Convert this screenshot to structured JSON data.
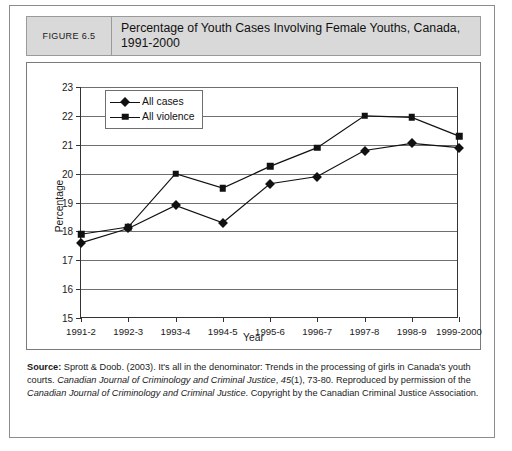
{
  "figure": {
    "number_label": "FIGURE 6.5",
    "title": "Percentage of Youth Cases Involving Female Youths, Canada, 1991-2000"
  },
  "source_note": {
    "label": "Source:",
    "part1": " Sprott & Doob. (2003). It's all in the denominator: Trends in the processing of girls in Canada's youth courts. ",
    "journal1": "Canadian Journal of Criminology and Criminal Justice",
    "part2": ", ",
    "volume": "45",
    "part3": "(1), 73-80. Reproduced by permission of the ",
    "journal2": "Canadian Journal of Criminology and Criminal Justice",
    "part4": ". Copyright by the Canadian Criminal Justice Association."
  },
  "chart_data": {
    "type": "line",
    "title": "Percentage of Youth Cases Involving Female Youths, Canada, 1991-2000",
    "xlabel": "Year",
    "ylabel": "Percentage",
    "ylim": [
      15,
      23
    ],
    "yticks": [
      15,
      16,
      17,
      18,
      19,
      20,
      21,
      22,
      23
    ],
    "grid": true,
    "legend_position": "top-left",
    "categories": [
      "1991-2",
      "1992-3",
      "1993-4",
      "1994-5",
      "1995-6",
      "1996-7",
      "1997-8",
      "1998-9",
      "1999-2000"
    ],
    "series": [
      {
        "name": "All cases",
        "marker": "diamond",
        "color": "#111111",
        "values": [
          17.6,
          18.1,
          18.9,
          18.3,
          19.65,
          19.9,
          20.8,
          21.05,
          20.9
        ]
      },
      {
        "name": "All violence",
        "marker": "square",
        "color": "#111111",
        "values": [
          17.9,
          18.15,
          20.0,
          19.5,
          20.25,
          20.9,
          22.0,
          21.95,
          21.3
        ]
      }
    ]
  }
}
